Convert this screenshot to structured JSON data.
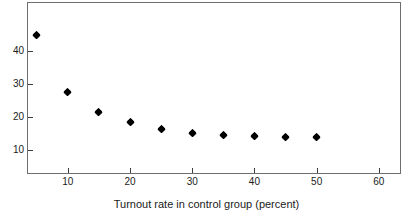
{
  "chart_data": {
    "type": "scatter",
    "title": "",
    "xlabel": "Turnout rate in control group (percent)",
    "ylabel": "",
    "xlim": [
      3.6,
      63.4
    ],
    "ylim": [
      3.1,
      54.6
    ],
    "xticks": [
      10,
      20,
      30,
      40,
      50,
      60
    ],
    "xtick_labels": [
      "10",
      "20",
      "30",
      "40",
      "50",
      "60"
    ],
    "yticks": [
      10,
      20,
      30,
      40
    ],
    "ytick_labels": [
      "10",
      "20",
      "30",
      "40"
    ],
    "grid": false,
    "legend": false,
    "marker": "diamond",
    "marker_color": "#000000",
    "frame_color": "#6e6e6e",
    "background": "#ffffff",
    "x": [
      5,
      10,
      15,
      20,
      25,
      30,
      35,
      40,
      45,
      50
    ],
    "y": [
      45.0,
      27.8,
      21.7,
      18.6,
      16.7,
      15.4,
      14.7,
      14.4,
      14.3,
      14.3
    ],
    "points": [
      {
        "x": 5,
        "y": 45.0
      },
      {
        "x": 10,
        "y": 27.8
      },
      {
        "x": 15,
        "y": 21.7
      },
      {
        "x": 20,
        "y": 18.6
      },
      {
        "x": 25,
        "y": 16.7
      },
      {
        "x": 30,
        "y": 15.4
      },
      {
        "x": 35,
        "y": 14.7
      },
      {
        "x": 40,
        "y": 14.4
      },
      {
        "x": 45,
        "y": 14.3
      },
      {
        "x": 50,
        "y": 14.3
      }
    ]
  }
}
